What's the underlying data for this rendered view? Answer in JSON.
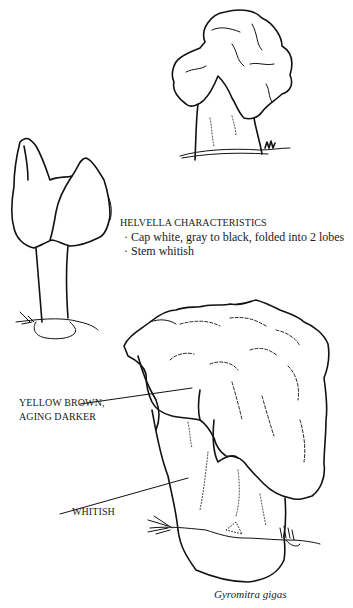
{
  "illustration": {
    "helvella_box": {
      "title": "HELVELLA CHARACTERISTICS",
      "bullets": [
        "Cap white, gray to black, folded into 2 lobes",
        "Stem whitish"
      ],
      "bullet_glyph": "·"
    },
    "labels": {
      "cap": [
        "YELLOW BROWN,",
        "AGING DARKER"
      ],
      "stem": "WHITISH"
    },
    "caption": "Gyromitra gigas",
    "colors": {
      "ink": "#111111",
      "paper": "#ffffff"
    }
  }
}
